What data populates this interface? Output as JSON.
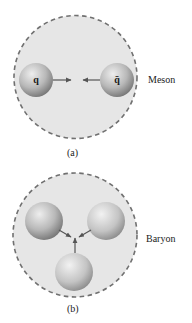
{
  "panels": [
    {
      "id": "a",
      "caption": "(a)",
      "name": "Meson",
      "container": {
        "cx": 75.5,
        "cy": 77,
        "r": 61.5
      },
      "quarks": [
        {
          "label": "q",
          "cx": 36,
          "cy": 80,
          "r": 17
        },
        {
          "label": "q̄",
          "cx": 117,
          "cy": 80,
          "r": 17
        }
      ],
      "arrows": [
        {
          "x1": 53,
          "y1": 80,
          "x2": 71,
          "y2": 80
        },
        {
          "x1": 100,
          "y1": 80,
          "x2": 83,
          "y2": 80
        }
      ]
    },
    {
      "id": "b",
      "caption": "(b)",
      "name": "Baryon",
      "container": {
        "cx": 75,
        "cy": 235,
        "r": 62
      },
      "quarks": [
        {
          "label": "",
          "cx": 44,
          "cy": 221,
          "r": 19
        },
        {
          "label": "",
          "cx": 106,
          "cy": 221,
          "r": 19
        },
        {
          "label": "",
          "cx": 74,
          "cy": 272,
          "r": 19
        }
      ],
      "arrows": [
        {
          "x1": 59,
          "y1": 230,
          "x2": 71,
          "y2": 237
        },
        {
          "x1": 91,
          "y1": 230,
          "x2": 79,
          "y2": 237
        },
        {
          "x1": 75,
          "y1": 253,
          "x2": 75,
          "y2": 237
        }
      ]
    }
  ],
  "colors": {
    "container_fill": "#e6e6e6",
    "container_stroke": "#707070",
    "sphere_light": "#e2e2e2",
    "sphere_dark": "#7a7a7a",
    "arrow": "#555555"
  }
}
